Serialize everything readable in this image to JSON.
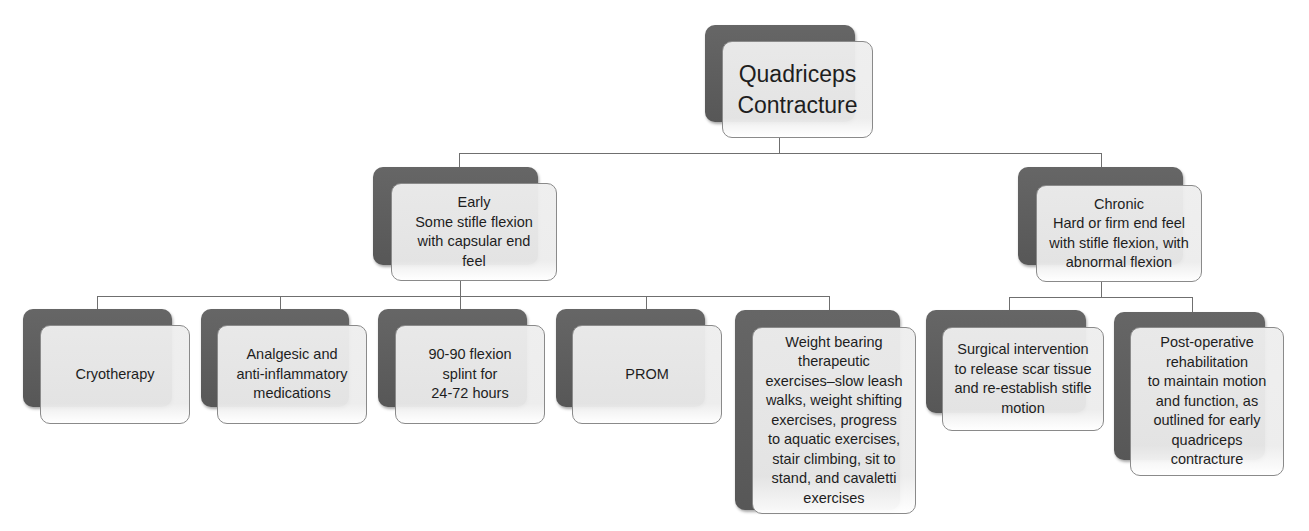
{
  "diagram": {
    "type": "hierarchy-tree",
    "root": {
      "label": "Quadriceps\nContracture"
    },
    "branches": [
      {
        "id": "early",
        "label": "Early\nSome stifle flexion\nwith capsular end\nfeel",
        "children": [
          {
            "label": "Cryotherapy"
          },
          {
            "label": "Analgesic and\nanti-inflammatory\nmedications"
          },
          {
            "label": "90-90 flexion\nsplint for\n24-72 hours"
          },
          {
            "label": "PROM"
          },
          {
            "label": "Weight bearing\ntherapeutic\nexercises–slow leash\nwalks, weight shifting\nexercises, progress\nto aquatic exercises,\nstair climbing, sit to\nstand, and cavaletti\nexercises"
          }
        ]
      },
      {
        "id": "chronic",
        "label": "Chronic\nHard or firm end feel\nwith stifle flexion, with\nabnormal flexion",
        "children": [
          {
            "label": "Surgical intervention\nto release scar tissue\nand re-establish stifle\nmotion"
          },
          {
            "label": "Post-operative\nrehabilitation\nto maintain motion\nand function, as\noutlined for early\nquadriceps\ncontracture"
          }
        ]
      }
    ],
    "colors": {
      "shadow_box": "#5e5e5e",
      "front_box": "#ececec",
      "connector": "#6f6f6f",
      "text": "#1e1e1e"
    }
  }
}
